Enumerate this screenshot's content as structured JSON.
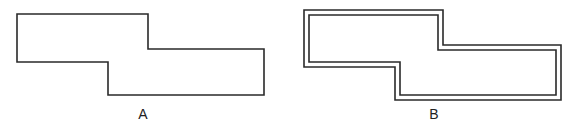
{
  "figures": [
    {
      "id": "A",
      "label": "A",
      "style": "single outline"
    },
    {
      "id": "B",
      "label": "B",
      "style": "double outline"
    }
  ],
  "colors": {
    "stroke": "#2a2a2a",
    "background": "#ffffff"
  }
}
